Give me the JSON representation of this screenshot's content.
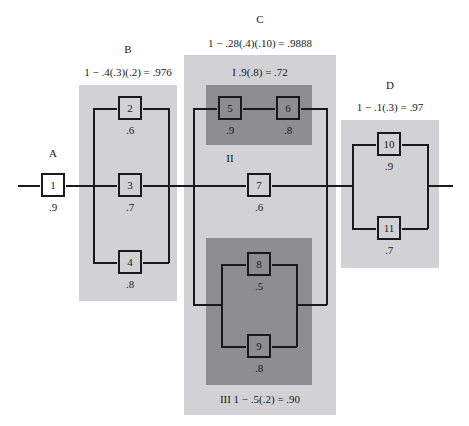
{
  "subsystems": {
    "A": {
      "label": "A",
      "formula": ""
    },
    "B": {
      "label": "B",
      "formula": "1 − .4(.3)(.2) = .976"
    },
    "C": {
      "label": "C",
      "formula": "1 − .28(.4)(.10) = .9888",
      "I": {
        "label": "I  .9(.8) = .72"
      },
      "II": {
        "label": "II"
      },
      "III": {
        "label": "III  1 − .5(.2) = .90"
      }
    },
    "D": {
      "label": "D",
      "formula": "1 − .1(.3) = .97"
    }
  },
  "components": [
    {
      "id": "1",
      "reliability": ".9"
    },
    {
      "id": "2",
      "reliability": ".6"
    },
    {
      "id": "3",
      "reliability": ".7"
    },
    {
      "id": "4",
      "reliability": ".8"
    },
    {
      "id": "5",
      "reliability": ".9"
    },
    {
      "id": "6",
      "reliability": ".8"
    },
    {
      "id": "7",
      "reliability": ".6"
    },
    {
      "id": "8",
      "reliability": ".5"
    },
    {
      "id": "9",
      "reliability": ".8"
    },
    {
      "id": "10",
      "reliability": ".9"
    },
    {
      "id": "11",
      "reliability": ".7"
    }
  ],
  "colors": {
    "light_region": "#d2d2d4",
    "dark_region": "#8e8e90",
    "line": "#1a1a1a"
  }
}
